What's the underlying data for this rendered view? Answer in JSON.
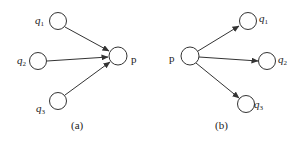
{
  "diagram": {
    "panels": [
      {
        "id": "a",
        "caption": "(a)",
        "center": {
          "label": "p"
        },
        "neighbors": [
          {
            "base": "q",
            "sub": "1"
          },
          {
            "base": "q",
            "sub": "2"
          },
          {
            "base": "q",
            "sub": "3"
          }
        ],
        "direction": "neighbors-to-center"
      },
      {
        "id": "b",
        "caption": "(b)",
        "center": {
          "label": "p"
        },
        "neighbors": [
          {
            "base": "q",
            "sub": "1"
          },
          {
            "base": "q",
            "sub": "2"
          },
          {
            "base": "q",
            "sub": "3"
          }
        ],
        "direction": "center-to-neighbors"
      }
    ],
    "colors": {
      "stroke": "#333333",
      "background": "#ffffff"
    }
  }
}
